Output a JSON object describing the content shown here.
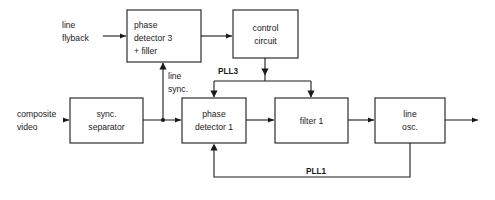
{
  "diagram": {
    "canvas": {
      "width": 495,
      "height": 200,
      "background": "#ffffff"
    },
    "stroke_color": "#1a1a1a",
    "blocks": [
      {
        "id": "phase-detector-3",
        "lines": [
          "phase",
          "detector 3",
          "+ filler"
        ],
        "line1": "phase",
        "line2": "detector 3",
        "line3": "+ filler",
        "x": 127,
        "y": 10,
        "w": 74,
        "h": 52
      },
      {
        "id": "control-circuit",
        "lines": [
          "control",
          "circuit"
        ],
        "line1": "control",
        "line2": "circuit",
        "x": 233,
        "y": 10,
        "w": 65,
        "h": 48
      },
      {
        "id": "sync-separator",
        "lines": [
          "sync.",
          "separator"
        ],
        "line1": "sync.",
        "line2": "separator",
        "x": 70,
        "y": 98,
        "w": 73,
        "h": 45
      },
      {
        "id": "phase-detector-1",
        "lines": [
          "phase",
          "detector 1"
        ],
        "line1": "phase",
        "line2": "detector 1",
        "x": 182,
        "y": 98,
        "w": 64,
        "h": 45
      },
      {
        "id": "filter-1",
        "lines": [
          "filter 1"
        ],
        "line1": "filter 1",
        "x": 275,
        "y": 98,
        "w": 73,
        "h": 45
      },
      {
        "id": "line-osc",
        "lines": [
          "line",
          "osc."
        ],
        "line1": "line",
        "line2": "osc.",
        "x": 375,
        "y": 98,
        "w": 70,
        "h": 45
      }
    ],
    "signal_labels": {
      "line_flyback_l1": "line",
      "line_flyback_l2": "flyback",
      "composite_video_l1": "composite",
      "composite_video_l2": "video",
      "line_sync_l1": "line",
      "line_sync_l2": "sync."
    },
    "loop_labels": {
      "pll3": "PLL3",
      "pll1": "PLL1"
    }
  }
}
